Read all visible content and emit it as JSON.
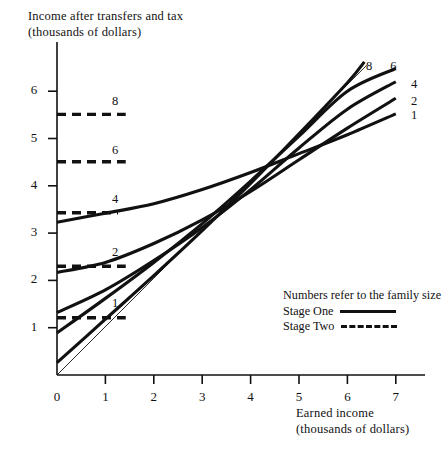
{
  "chart_data": {
    "type": "line",
    "title": "",
    "ylabel_line1": "Income after transfers and tax",
    "ylabel_line2": "(thousands of dollars)",
    "xlabel_line1": "Earned income",
    "xlabel_line2": "(thousands of dollars)",
    "xlim": [
      0,
      7.6
    ],
    "ylim": [
      0,
      6.6
    ],
    "xticks": [
      "0",
      "1",
      "2",
      "3",
      "4",
      "5",
      "6",
      "7"
    ],
    "yticks": [
      "1",
      "2",
      "3",
      "4",
      "5",
      "6"
    ],
    "grid": false,
    "legend_position": "inside-lower-right",
    "legend_note": "Numbers refer to the family size",
    "legend_entries": [
      {
        "label": "Stage One",
        "style": "solid"
      },
      {
        "label": "Stage Two",
        "style": "dashed"
      }
    ],
    "annotations": [
      {
        "text": "8",
        "x": 1.2,
        "y": 5.75,
        "role": "dashed-line-label"
      },
      {
        "text": "6",
        "x": 1.2,
        "y": 4.72,
        "role": "dashed-line-label"
      },
      {
        "text": "4",
        "x": 1.2,
        "y": 3.68,
        "role": "dashed-line-label"
      },
      {
        "text": "2",
        "x": 1.2,
        "y": 2.55,
        "role": "dashed-line-label"
      },
      {
        "text": "1",
        "x": 1.2,
        "y": 1.48,
        "role": "dashed-line-label"
      },
      {
        "text": "8",
        "x": 6.45,
        "y": 6.48,
        "role": "curve-end-label"
      },
      {
        "text": "6",
        "x": 6.95,
        "y": 6.48,
        "role": "curve-end-label"
      },
      {
        "text": "4",
        "x": 7.38,
        "y": 6.12,
        "role": "curve-end-label"
      },
      {
        "text": "2",
        "x": 7.38,
        "y": 5.75,
        "role": "curve-end-label"
      },
      {
        "text": "1",
        "x": 7.38,
        "y": 5.45,
        "role": "curve-end-label"
      }
    ],
    "series": [
      {
        "name": "8",
        "family_size": 8,
        "stage": "Stage Two",
        "style": "dashed",
        "x": [
          0.0,
          1.42
        ],
        "values": [
          5.51,
          5.51
        ]
      },
      {
        "name": "6",
        "family_size": 6,
        "stage": "Stage Two",
        "style": "dashed",
        "x": [
          0.0,
          1.42
        ],
        "values": [
          4.51,
          4.51
        ]
      },
      {
        "name": "4",
        "family_size": 4,
        "stage": "Stage Two",
        "style": "dashed",
        "x": [
          0.0,
          1.26
        ],
        "values": [
          3.43,
          3.43
        ]
      },
      {
        "name": "2",
        "family_size": 2,
        "stage": "Stage Two",
        "style": "dashed",
        "x": [
          0.0,
          1.42
        ],
        "values": [
          2.3,
          2.3
        ]
      },
      {
        "name": "1",
        "family_size": 1,
        "stage": "Stage Two",
        "style": "dashed",
        "x": [
          0.0,
          1.42
        ],
        "values": [
          1.21,
          1.21
        ]
      },
      {
        "name": "8",
        "family_size": 8,
        "stage": "Stage One",
        "style": "solid",
        "x": [
          0.0,
          1.0,
          2.0,
          3.0,
          4.0,
          5.0,
          6.0,
          6.35
        ],
        "values": [
          0.26,
          1.18,
          2.1,
          3.05,
          4.05,
          5.1,
          6.18,
          6.62
        ]
      },
      {
        "name": "6",
        "family_size": 6,
        "stage": "Stage One",
        "style": "solid",
        "x": [
          0.0,
          1.0,
          2.0,
          3.0,
          4.0,
          5.0,
          6.0,
          7.0
        ],
        "values": [
          0.89,
          1.62,
          2.38,
          3.2,
          4.1,
          5.05,
          6.0,
          6.48
        ]
      },
      {
        "name": "4",
        "family_size": 4,
        "stage": "Stage One",
        "style": "solid",
        "x": [
          0.0,
          1.0,
          2.0,
          3.0,
          4.0,
          5.0,
          6.0,
          7.0
        ],
        "values": [
          1.32,
          1.8,
          2.42,
          3.12,
          3.92,
          4.8,
          5.62,
          6.2
        ]
      },
      {
        "name": "2",
        "family_size": 2,
        "stage": "Stage One",
        "style": "solid",
        "x": [
          0.0,
          1.0,
          2.0,
          3.0,
          4.0,
          5.0,
          6.0,
          7.0
        ],
        "values": [
          2.17,
          2.38,
          2.78,
          3.28,
          3.88,
          4.55,
          5.22,
          5.85
        ]
      },
      {
        "name": "1",
        "family_size": 1,
        "stage": "Stage One",
        "style": "solid",
        "x": [
          0.0,
          1.0,
          2.0,
          3.0,
          4.0,
          5.0,
          6.0,
          7.0
        ],
        "values": [
          3.23,
          3.42,
          3.62,
          3.92,
          4.28,
          4.68,
          5.08,
          5.52
        ]
      },
      {
        "name": "45-degree reference",
        "stage": "reference",
        "style": "thin-solid",
        "x": [
          0.0,
          6.4
        ],
        "values": [
          0.0,
          6.55
        ]
      }
    ]
  },
  "axis": {
    "x_tick_values": [
      0,
      1,
      2,
      3,
      4,
      5,
      6,
      7
    ],
    "y_tick_values": [
      1,
      2,
      3,
      4,
      5,
      6
    ]
  }
}
